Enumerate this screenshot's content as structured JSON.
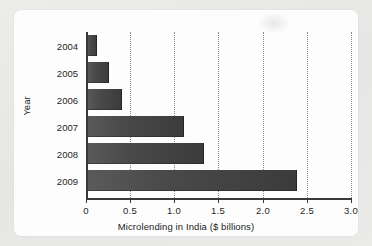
{
  "chart_data": {
    "type": "bar",
    "orientation": "horizontal",
    "title": "",
    "xlabel": "Microlending in India ($ billions)",
    "ylabel": "Year",
    "categories": [
      "2004",
      "2005",
      "2006",
      "2007",
      "2008",
      "2009"
    ],
    "values": [
      0.11,
      0.25,
      0.4,
      1.1,
      1.32,
      2.38
    ],
    "xlim": [
      0,
      3.0
    ],
    "xticks": [
      "0",
      "0.5",
      "1.0",
      "1.5",
      "2.0",
      "2.5",
      "3.0"
    ],
    "xtick_values": [
      0,
      0.5,
      1.0,
      1.5,
      2.0,
      2.5,
      3.0
    ],
    "grid": "vertical-dotted",
    "legend": "none",
    "bar_color": "#444444",
    "axis_color": "#3a3a3a",
    "gridline_color": "#8b8b8b",
    "background_color": "#fdfdfd",
    "page_color": "#e9e9e7"
  }
}
